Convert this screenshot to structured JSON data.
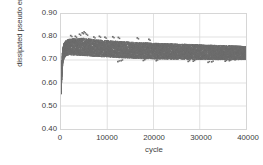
{
  "chart_data": {
    "type": "scatter",
    "title": "",
    "xlabel": "cycle",
    "ylabel": "dissipated pseudo energy, MPa",
    "ylabel_sup": "-1",
    "xlim": [
      0,
      40000
    ],
    "ylim": [
      0.4,
      0.9
    ],
    "xticks": [
      "0",
      "10000",
      "20000",
      "30000",
      "40000"
    ],
    "xtick_values": [
      0,
      10000,
      20000,
      30000,
      40000
    ],
    "yticks": [
      "0.40",
      "0.50",
      "0.60",
      "0.70",
      "0.80",
      "0.90"
    ],
    "ytick_values": [
      0.4,
      0.5,
      0.6,
      0.7,
      0.8,
      0.9
    ],
    "grid": "both",
    "legend": "none",
    "marker_color": "#6e6e6e",
    "grid_color": "#d9d9d9",
    "axis_text_color": "#404040",
    "series": [
      {
        "name": "dissipated pseudo energy",
        "description": "dense scatter band of per-cycle values; sharp rise from 0.55 at cycle 0 to a 0.74-0.80 band by cycle 1500, then slow decline with band narrowing to 0.71-0.76 at cycle 40000",
        "band_points": [
          {
            "x": 0,
            "low": 0.553,
            "high": 0.575
          },
          {
            "x": 120,
            "low": 0.6,
            "high": 0.66
          },
          {
            "x": 260,
            "low": 0.655,
            "high": 0.722
          },
          {
            "x": 420,
            "low": 0.69,
            "high": 0.752
          },
          {
            "x": 650,
            "low": 0.708,
            "high": 0.772
          },
          {
            "x": 1000,
            "low": 0.718,
            "high": 0.784
          },
          {
            "x": 1600,
            "low": 0.722,
            "high": 0.79
          },
          {
            "x": 2600,
            "low": 0.722,
            "high": 0.792
          },
          {
            "x": 4000,
            "low": 0.72,
            "high": 0.793
          },
          {
            "x": 5200,
            "low": 0.719,
            "high": 0.796
          },
          {
            "x": 6500,
            "low": 0.717,
            "high": 0.79
          },
          {
            "x": 8000,
            "low": 0.715,
            "high": 0.787
          },
          {
            "x": 10000,
            "low": 0.713,
            "high": 0.784
          },
          {
            "x": 12500,
            "low": 0.71,
            "high": 0.781
          },
          {
            "x": 15000,
            "low": 0.708,
            "high": 0.778
          },
          {
            "x": 17500,
            "low": 0.706,
            "high": 0.775
          },
          {
            "x": 20000,
            "low": 0.705,
            "high": 0.773
          },
          {
            "x": 23000,
            "low": 0.704,
            "high": 0.771
          },
          {
            "x": 26000,
            "low": 0.703,
            "high": 0.769
          },
          {
            "x": 29000,
            "low": 0.702,
            "high": 0.767
          },
          {
            "x": 32000,
            "low": 0.702,
            "high": 0.765
          },
          {
            "x": 35000,
            "low": 0.701,
            "high": 0.763
          },
          {
            "x": 38000,
            "low": 0.701,
            "high": 0.761
          },
          {
            "x": 40000,
            "low": 0.703,
            "high": 0.758
          }
        ],
        "upper_outliers": [
          {
            "x": 2100,
            "y": 0.806
          },
          {
            "x": 3100,
            "y": 0.803
          },
          {
            "x": 4000,
            "y": 0.812
          },
          {
            "x": 4600,
            "y": 0.818
          },
          {
            "x": 5000,
            "y": 0.822
          },
          {
            "x": 5500,
            "y": 0.812
          },
          {
            "x": 7100,
            "y": 0.8
          },
          {
            "x": 8300,
            "y": 0.803
          },
          {
            "x": 9500,
            "y": 0.799
          },
          {
            "x": 11200,
            "y": 0.801
          },
          {
            "x": 12400,
            "y": 0.798
          },
          {
            "x": 16500,
            "y": 0.796
          },
          {
            "x": 19000,
            "y": 0.79
          }
        ],
        "lower_outliers": [
          {
            "x": 12300,
            "y": 0.693
          },
          {
            "x": 13000,
            "y": 0.697
          },
          {
            "x": 17800,
            "y": 0.698
          },
          {
            "x": 20600,
            "y": 0.697
          },
          {
            "x": 27500,
            "y": 0.694
          },
          {
            "x": 28600,
            "y": 0.695
          },
          {
            "x": 31800,
            "y": 0.69
          },
          {
            "x": 32600,
            "y": 0.692
          },
          {
            "x": 35500,
            "y": 0.695
          },
          {
            "x": 36400,
            "y": 0.697
          }
        ]
      }
    ]
  }
}
